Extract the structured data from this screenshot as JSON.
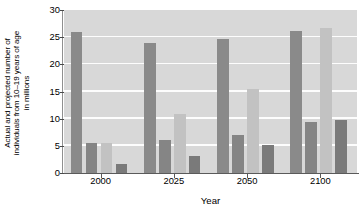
{
  "chart_data": {
    "type": "bar",
    "title": "",
    "subtitle": "",
    "xlabel": "Year",
    "ylabel": "Actual and projected number of individuals from 10–19 years of age in millions",
    "ylabel_lines": [
      "Actual and projected number of",
      "individuals from 10–19 years of age",
      "in millions"
    ],
    "categories": [
      "2000",
      "2025",
      "2050",
      "2100"
    ],
    "yticks": [
      0,
      5,
      10,
      15,
      20,
      25,
      30
    ],
    "ytick_labels": [
      "0",
      "5",
      "10",
      "15",
      "20",
      "25",
      "30"
    ],
    "ylim": [
      0,
      30
    ],
    "grid": true,
    "grid_color": "#fdfdfd",
    "plot_background": "#d8d8d8",
    "legend_position": "none",
    "series": [
      {
        "name": "series-1",
        "color": "#8a8a8a",
        "values": [
          25.9,
          23.9,
          24.6,
          26.1
        ]
      },
      {
        "name": "series-2",
        "color": "#c2c2c2",
        "values": [
          5.6,
          10.8,
          15.4,
          26.6
        ]
      },
      {
        "name": "series-3",
        "color": "#7a7a7a",
        "values": [
          1.6,
          3.1,
          5.1,
          9.8
        ]
      }
    ],
    "extra_bars": {
      "note": "each group additionally shows a mid dark bar",
      "color": "#858585",
      "values": [
        5.6,
        6.1,
        7.0,
        9.4
      ]
    }
  },
  "axis": {
    "ylabel_text": "Actual and projected number of individuals from 10–19 years of age in millions",
    "xlabel_text": "Year"
  }
}
